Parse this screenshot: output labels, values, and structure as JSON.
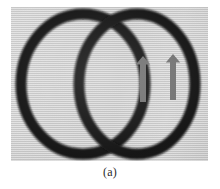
{
  "figure": {
    "caption": "(a)",
    "panel_label": "(a)",
    "background_color": "#ffffff",
    "photo": {
      "background_color": "#c8c8c8",
      "left": 11,
      "top": 7,
      "width": 197,
      "height": 154
    },
    "rings": {
      "stroke_color": "#0d0d0d",
      "stroke_width": 11,
      "count": 2,
      "description": "two overlapping black circular rings",
      "items": [
        {
          "name": "left-ring",
          "cx": 72,
          "cy": 77,
          "rx": 62,
          "ry": 70
        },
        {
          "name": "right-ring",
          "cx": 126,
          "cy": 77,
          "rx": 58,
          "ry": 70
        }
      ]
    },
    "arrows": {
      "color": "#6e6e6e",
      "direction": "up",
      "count": 2,
      "items": [
        {
          "name": "arrow-left",
          "x": 135,
          "y": 53,
          "width": 16,
          "height": 46
        },
        {
          "name": "arrow-right",
          "x": 165,
          "y": 51,
          "width": 16,
          "height": 46
        }
      ]
    }
  }
}
